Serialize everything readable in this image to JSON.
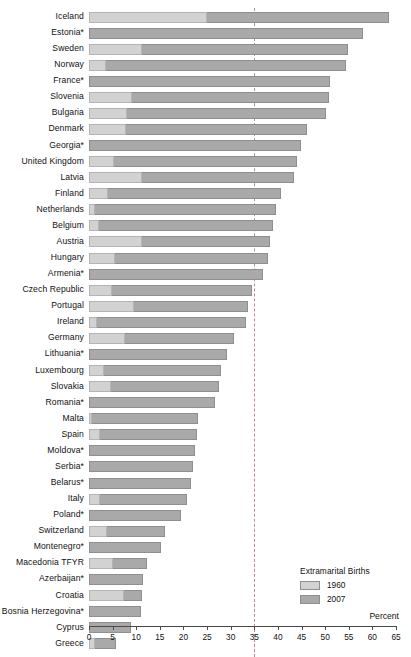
{
  "chart_data": {
    "type": "bar",
    "orientation": "horizontal",
    "style": "overlaid",
    "title": "",
    "xlabel": "Percent",
    "ylabel": "",
    "xlim": [
      0,
      65
    ],
    "xticks": [
      0,
      5,
      10,
      15,
      20,
      25,
      30,
      35,
      40,
      45,
      50,
      55,
      60,
      65
    ],
    "grid": false,
    "reference_line": 35,
    "legend": {
      "title": "Extramarital Births",
      "position": "bottom-right",
      "entries": [
        {
          "name": "1960",
          "color": "#d2d2d2"
        },
        {
          "name": "2007",
          "color": "#a9a9a9"
        }
      ]
    },
    "categories": [
      "Iceland",
      "Estonia*",
      "Sweden",
      "Norway",
      "France*",
      "Slovenia",
      "Bulgaria",
      "Denmark",
      "Georgia*",
      "United Kingdom",
      "Latvia",
      "Finland",
      "Netherlands",
      "Belgium",
      "Austria",
      "Hungary",
      "Armenia*",
      "Czech Republic",
      "Portugal",
      "Ireland",
      "Germany",
      "Lithuania*",
      "Luxembourg",
      "Slovakia",
      "Romania*",
      "Malta",
      "Spain",
      "Moldova*",
      "Serbia*",
      "Belarus*",
      "Italy",
      "Poland*",
      "Switzerland",
      "Montenegro*",
      "Macedonia TFYR",
      "Azerbaijan*",
      "Croatia",
      "Bosnia Herzegovina*",
      "Cyprus",
      "Greece"
    ],
    "series": [
      {
        "name": "1960",
        "color": "#d2d2d2",
        "values": [
          25.0,
          0.0,
          11.3,
          3.7,
          0.0,
          9.1,
          8.0,
          7.8,
          0.0,
          5.2,
          11.3,
          4.0,
          1.3,
          2.1,
          11.3,
          5.5,
          0.0,
          4.9,
          9.5,
          1.6,
          7.6,
          0.0,
          3.2,
          4.7,
          0.0,
          0.7,
          2.3,
          0.0,
          0.0,
          0.0,
          2.4,
          0.0,
          3.8,
          0.0,
          5.1,
          0.0,
          7.4,
          0.0,
          0.0,
          1.2
        ]
      },
      {
        "name": "2007",
        "color": "#a9a9a9",
        "values": [
          63.5,
          58.0,
          54.8,
          54.5,
          51.0,
          50.8,
          50.2,
          46.1,
          44.8,
          44.0,
          43.4,
          40.6,
          39.5,
          39.0,
          38.3,
          37.9,
          36.8,
          34.5,
          33.6,
          33.2,
          30.8,
          29.2,
          28.0,
          27.6,
          26.7,
          23.0,
          22.9,
          22.4,
          22.0,
          21.6,
          20.7,
          19.5,
          16.0,
          15.3,
          12.2,
          11.5,
          11.3,
          11.0,
          8.8,
          5.8
        ]
      }
    ]
  }
}
